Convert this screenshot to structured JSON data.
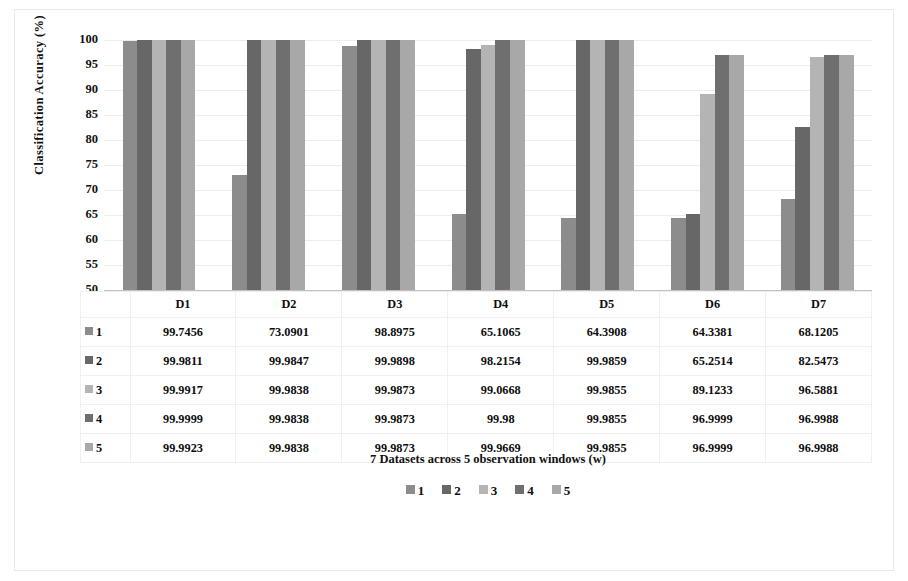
{
  "chart_data": {
    "type": "bar",
    "title": "",
    "xlabel": "7 Datasets across 5 observation windows (w)",
    "ylabel": "Classification Accuracy (%)",
    "ylim": [
      50,
      100
    ],
    "yticks": [
      100,
      95,
      90,
      85,
      80,
      75,
      70,
      65,
      60,
      55,
      50
    ],
    "grid": true,
    "legend_position": "bottom",
    "categories": [
      "D1",
      "D2",
      "D3",
      "D4",
      "D5",
      "D6",
      "D7"
    ],
    "series": [
      {
        "name": "1",
        "color": "#8c8c8c",
        "values": [
          99.7456,
          73.0901,
          98.8975,
          65.1065,
          64.3908,
          64.3381,
          68.1205
        ]
      },
      {
        "name": "2",
        "color": "#676767",
        "values": [
          99.9811,
          99.9847,
          99.9898,
          98.2154,
          99.9859,
          65.2514,
          82.5473
        ]
      },
      {
        "name": "3",
        "color": "#b4b4b4",
        "values": [
          99.9917,
          99.9838,
          99.9873,
          99.0668,
          99.9855,
          89.1233,
          96.5881
        ]
      },
      {
        "name": "4",
        "color": "#6f6f6f",
        "values": [
          99.9999,
          99.9838,
          99.9873,
          99.98,
          99.9855,
          96.9999,
          96.9988
        ]
      },
      {
        "name": "5",
        "color": "#a8a8a8",
        "values": [
          99.9923,
          99.9838,
          99.9873,
          99.9669,
          99.9855,
          96.9999,
          96.9988
        ]
      }
    ],
    "data_table": {
      "column_headers": [
        "",
        "D1",
        "D2",
        "D3",
        "D4",
        "D5",
        "D6",
        "D7"
      ],
      "rows": [
        {
          "label": "1",
          "color": "#8c8c8c",
          "cells": [
            "99.7456",
            "73.0901",
            "98.8975",
            "65.1065",
            "64.3908",
            "64.3381",
            "68.1205"
          ]
        },
        {
          "label": "2",
          "color": "#676767",
          "cells": [
            "99.9811",
            "99.9847",
            "99.9898",
            "98.2154",
            "99.9859",
            "65.2514",
            "82.5473"
          ]
        },
        {
          "label": "3",
          "color": "#b4b4b4",
          "cells": [
            "99.9917",
            "99.9838",
            "99.9873",
            "99.0668",
            "99.9855",
            "89.1233",
            "96.5881"
          ]
        },
        {
          "label": "4",
          "color": "#6f6f6f",
          "cells": [
            "99.9999",
            "99.9838",
            "99.9873",
            "99.98",
            "99.9855",
            "96.9999",
            "96.9988"
          ]
        },
        {
          "label": "5",
          "color": "#a8a8a8",
          "cells": [
            "99.9923",
            "99.9838",
            "99.9873",
            "99.9669",
            "99.9855",
            "96.9999",
            "96.9988"
          ]
        }
      ]
    },
    "legend_entries": [
      {
        "label": "1",
        "color": "#8c8c8c"
      },
      {
        "label": "2",
        "color": "#676767"
      },
      {
        "label": "3",
        "color": "#b4b4b4"
      },
      {
        "label": "4",
        "color": "#6f6f6f"
      },
      {
        "label": "5",
        "color": "#a8a8a8"
      }
    ]
  }
}
